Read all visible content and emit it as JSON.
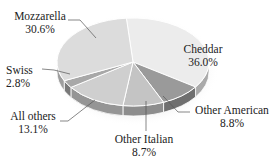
{
  "chart_data": {
    "type": "pie",
    "title": "",
    "style": "3d",
    "categories": [
      "Cheddar",
      "Other American",
      "Other Italian",
      "All others",
      "Swiss",
      "Mozzarella"
    ],
    "values": [
      36.0,
      8.8,
      8.7,
      13.1,
      2.8,
      30.6
    ],
    "unit": "%",
    "slices": [
      {
        "name": "Cheddar",
        "value": 36.0,
        "label": "36.0%",
        "color": "#ececec"
      },
      {
        "name": "Other American",
        "value": 8.8,
        "label": "8.8%",
        "color": "#9a9a9a"
      },
      {
        "name": "Other Italian",
        "value": 8.7,
        "label": "8.7%",
        "color": "#c4c4c4"
      },
      {
        "name": "All others",
        "value": 13.1,
        "label": "13.1%",
        "color": "#cfcfcf"
      },
      {
        "name": "Swiss",
        "value": 2.8,
        "label": "2.8%",
        "color": "#a8a8a8"
      },
      {
        "name": "Mozzarella",
        "value": 30.6,
        "label": "30.6%",
        "color": "#dcdcdc"
      }
    ],
    "legend": "none (labels with leader lines)"
  },
  "labels": {
    "cheddar": {
      "name": "Cheddar",
      "pct": "36.0%"
    },
    "other_american": {
      "name": "Other American",
      "pct": "8.8%"
    },
    "other_italian": {
      "name": "Other Italian",
      "pct": "8.7%"
    },
    "all_others": {
      "name": "All others",
      "pct": "13.1%"
    },
    "swiss": {
      "name": "Swiss",
      "pct": "2.8%"
    },
    "mozzarella": {
      "name": "Mozzarella",
      "pct": "30.6%"
    }
  }
}
